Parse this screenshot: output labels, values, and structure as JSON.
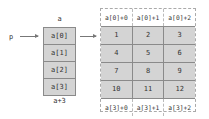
{
  "pointer": {
    "label": "p"
  },
  "array_a": {
    "title": "a",
    "cells": [
      "a[0]",
      "a[1]",
      "a[2]",
      "a[3]"
    ],
    "footer": "a+3"
  },
  "matrix": {
    "header": [
      "a[0]+0",
      "a[0]+1",
      "a[0]+2"
    ],
    "rows": [
      [
        "1",
        "2",
        "3"
      ],
      [
        "4",
        "5",
        "6"
      ],
      [
        "7",
        "8",
        "9"
      ],
      [
        "10",
        "11",
        "12"
      ]
    ],
    "footer": [
      "a[3]+0",
      "a[3]+1",
      "a[3]+2"
    ]
  },
  "colors": {
    "cell_fill": "#d4d4d4",
    "cell_border": "#8a8a8a",
    "arrow": "#777777"
  }
}
